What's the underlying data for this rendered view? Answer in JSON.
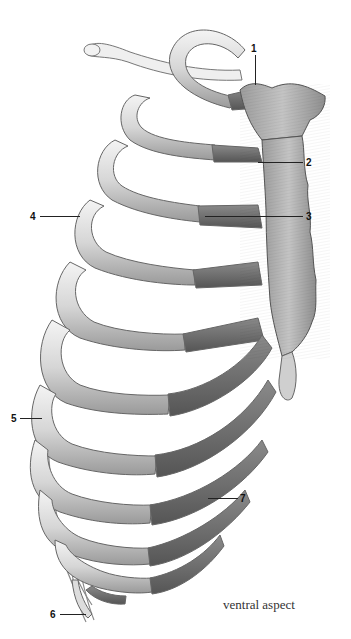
{
  "figure": {
    "caption": "ventral aspect",
    "colors": {
      "background": "#ffffff",
      "bone_light": "#e9e9e9",
      "bone_mid": "#bdbdbd",
      "cartilage_dark": "#6f6f6f",
      "sternum": "#a8a8a8",
      "outline": "#555555",
      "label_text": "#111111"
    }
  },
  "labels": [
    {
      "number": "1",
      "x": 251,
      "y": 44
    },
    {
      "number": "2",
      "x": 306,
      "y": 158
    },
    {
      "number": "3",
      "x": 306,
      "y": 212
    },
    {
      "number": "4",
      "x": 30,
      "y": 212
    },
    {
      "number": "5",
      "x": 11,
      "y": 414
    },
    {
      "number": "6",
      "x": 50,
      "y": 610
    },
    {
      "number": "7",
      "x": 240,
      "y": 496
    }
  ]
}
